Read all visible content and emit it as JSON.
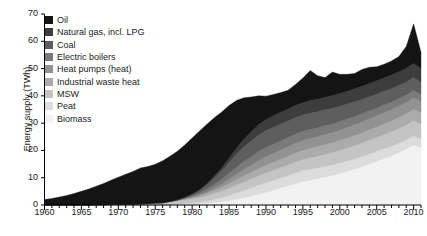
{
  "chart_data": {
    "type": "area",
    "title": "",
    "xlabel": "",
    "ylabel": "Energy supply (TWh)",
    "ylim": [
      0,
      70
    ],
    "xlim": [
      1960,
      2011
    ],
    "y_ticks": [
      0,
      10,
      20,
      30,
      40,
      50,
      60,
      70
    ],
    "x_ticks": [
      1960,
      1965,
      1970,
      1975,
      1980,
      1985,
      1990,
      1995,
      2000,
      2005,
      2010
    ],
    "x_minor_tick_interval": 1,
    "grid": false,
    "legend_position": "top-left",
    "stack_order_top_to_bottom": [
      "Oil",
      "Natural gas, incl. LPG",
      "Coal",
      "Electric boilers",
      "Heat pumps (heat)",
      "Industrial waste heat",
      "MSW",
      "Peat",
      "Biomass"
    ],
    "x": [
      1960,
      1961,
      1962,
      1963,
      1964,
      1965,
      1966,
      1967,
      1968,
      1969,
      1970,
      1971,
      1972,
      1973,
      1974,
      1975,
      1976,
      1977,
      1978,
      1979,
      1980,
      1981,
      1982,
      1983,
      1984,
      1985,
      1986,
      1987,
      1988,
      1989,
      1990,
      1991,
      1992,
      1993,
      1994,
      1995,
      1996,
      1997,
      1998,
      1999,
      2000,
      2001,
      2002,
      2003,
      2004,
      2005,
      2006,
      2007,
      2008,
      2009,
      2010,
      2011
    ],
    "series": [
      {
        "name": "Biomass",
        "color": "#f2f2f2",
        "values": [
          0.0,
          0.0,
          0.0,
          0.0,
          0.0,
          0.0,
          0.0,
          0.0,
          0.0,
          0.0,
          0.0,
          0.0,
          0.0,
          0.0,
          0.0,
          0.0,
          0.0,
          0.1,
          0.1,
          0.2,
          0.3,
          0.4,
          0.6,
          0.9,
          1.2,
          1.6,
          2.1,
          2.6,
          3.2,
          3.9,
          4.6,
          5.4,
          6.2,
          7.0,
          7.9,
          8.6,
          9.1,
          9.6,
          10.2,
          10.8,
          11.5,
          12.3,
          13.1,
          14.0,
          15.0,
          16.0,
          17.0,
          18.0,
          19.2,
          20.5,
          22.0,
          21.0
        ]
      },
      {
        "name": "Peat",
        "color": "#dcdcdc",
        "values": [
          0.0,
          0.0,
          0.0,
          0.0,
          0.0,
          0.0,
          0.0,
          0.0,
          0.0,
          0.0,
          0.0,
          0.0,
          0.0,
          0.0,
          0.0,
          0.0,
          0.0,
          0.1,
          0.2,
          0.3,
          0.4,
          0.6,
          0.9,
          1.2,
          1.5,
          1.9,
          2.3,
          2.7,
          3.0,
          3.3,
          3.5,
          3.6,
          3.7,
          3.8,
          3.9,
          4.0,
          4.0,
          4.0,
          4.0,
          3.9,
          3.9,
          3.9,
          3.8,
          3.8,
          3.7,
          3.6,
          3.6,
          3.5,
          3.4,
          3.3,
          3.3,
          3.2
        ]
      },
      {
        "name": "MSW",
        "color": "#c4c4c4",
        "values": [
          0.0,
          0.0,
          0.0,
          0.0,
          0.0,
          0.0,
          0.0,
          0.1,
          0.1,
          0.2,
          0.2,
          0.3,
          0.3,
          0.4,
          0.5,
          0.6,
          0.7,
          0.9,
          1.1,
          1.3,
          1.5,
          1.7,
          1.9,
          2.2,
          2.4,
          2.7,
          2.9,
          3.1,
          3.3,
          3.5,
          3.6,
          3.7,
          3.8,
          3.9,
          4.0,
          4.1,
          4.2,
          4.3,
          4.4,
          4.5,
          4.6,
          4.7,
          4.8,
          4.9,
          5.0,
          5.1,
          5.2,
          5.3,
          5.4,
          5.5,
          5.6,
          5.5
        ]
      },
      {
        "name": "Industrial waste heat",
        "color": "#ababab",
        "values": [
          0.0,
          0.0,
          0.0,
          0.0,
          0.0,
          0.0,
          0.0,
          0.0,
          0.0,
          0.0,
          0.0,
          0.0,
          0.0,
          0.0,
          0.0,
          0.1,
          0.1,
          0.2,
          0.3,
          0.4,
          0.5,
          0.7,
          0.9,
          1.1,
          1.4,
          1.7,
          2.0,
          2.3,
          2.5,
          2.7,
          2.9,
          3.0,
          3.1,
          3.2,
          3.3,
          3.4,
          3.5,
          3.5,
          3.6,
          3.6,
          3.7,
          3.7,
          3.8,
          3.8,
          3.9,
          3.9,
          4.0,
          4.0,
          4.1,
          4.1,
          4.2,
          4.1
        ]
      },
      {
        "name": "Heat pumps (heat)",
        "color": "#929292",
        "values": [
          0.0,
          0.0,
          0.0,
          0.0,
          0.0,
          0.0,
          0.0,
          0.0,
          0.0,
          0.0,
          0.0,
          0.0,
          0.0,
          0.0,
          0.0,
          0.0,
          0.0,
          0.0,
          0.0,
          0.1,
          0.2,
          0.3,
          0.5,
          0.8,
          1.1,
          1.5,
          1.9,
          2.3,
          2.6,
          2.9,
          3.1,
          3.2,
          3.3,
          3.4,
          3.5,
          3.5,
          3.6,
          3.6,
          3.7,
          3.7,
          3.8,
          3.8,
          3.9,
          3.9,
          4.0,
          4.0,
          4.1,
          4.1,
          4.2,
          4.2,
          4.3,
          4.2
        ]
      },
      {
        "name": "Electric boilers",
        "color": "#7a7a7a",
        "values": [
          0.0,
          0.0,
          0.0,
          0.0,
          0.0,
          0.0,
          0.0,
          0.0,
          0.0,
          0.0,
          0.0,
          0.0,
          0.0,
          0.0,
          0.0,
          0.0,
          0.0,
          0.0,
          0.1,
          0.2,
          0.4,
          0.7,
          1.0,
          1.4,
          1.8,
          2.2,
          2.6,
          2.9,
          3.1,
          3.3,
          3.4,
          3.4,
          3.4,
          3.4,
          3.4,
          3.4,
          3.3,
          3.3,
          3.2,
          3.2,
          3.1,
          3.1,
          3.0,
          3.0,
          2.9,
          2.9,
          2.8,
          2.8,
          2.7,
          2.7,
          2.6,
          2.5
        ]
      },
      {
        "name": "Coal",
        "color": "#5e5e5e",
        "values": [
          0.0,
          0.0,
          0.0,
          0.0,
          0.0,
          0.0,
          0.0,
          0.0,
          0.0,
          0.0,
          0.0,
          0.0,
          0.0,
          0.0,
          0.0,
          0.0,
          0.0,
          0.0,
          0.1,
          0.3,
          0.6,
          1.0,
          1.6,
          2.3,
          3.1,
          4.0,
          4.8,
          5.4,
          5.8,
          6.1,
          6.2,
          6.2,
          6.2,
          6.1,
          6.1,
          6.0,
          6.0,
          5.9,
          5.8,
          5.7,
          5.6,
          5.5,
          5.4,
          5.3,
          5.2,
          5.1,
          5.0,
          4.9,
          4.8,
          4.7,
          4.7,
          4.5
        ]
      },
      {
        "name": "Natural gas, incl. LPG",
        "color": "#3d3d3d",
        "values": [
          0.0,
          0.0,
          0.0,
          0.0,
          0.0,
          0.0,
          0.0,
          0.0,
          0.0,
          0.0,
          0.0,
          0.0,
          0.0,
          0.0,
          0.0,
          0.0,
          0.0,
          0.0,
          0.0,
          0.0,
          0.1,
          0.2,
          0.4,
          0.7,
          1.1,
          1.6,
          2.2,
          2.8,
          3.3,
          3.7,
          4.0,
          4.2,
          4.3,
          4.4,
          4.5,
          4.5,
          4.6,
          4.6,
          4.6,
          4.7,
          4.7,
          4.7,
          4.8,
          4.8,
          4.8,
          4.9,
          4.9,
          5.0,
          5.0,
          5.1,
          5.2,
          5.0
        ]
      },
      {
        "name": "Oil",
        "color": "#141414",
        "values": [
          2.0,
          2.4,
          2.9,
          3.5,
          4.2,
          5.0,
          5.9,
          6.8,
          7.8,
          8.9,
          10.0,
          11.0,
          12.0,
          13.2,
          13.6,
          14.2,
          15.4,
          16.6,
          17.8,
          19.2,
          20.6,
          21.5,
          21.8,
          21.4,
          20.5,
          19.3,
          17.5,
          15.2,
          12.8,
          10.6,
          8.6,
          7.8,
          7.2,
          6.9,
          7.6,
          9.0,
          11.0,
          8.6,
          7.2,
          8.6,
          7.0,
          6.2,
          5.6,
          6.2,
          6.0,
          5.2,
          5.0,
          5.2,
          5.6,
          8.0,
          14.5,
          6.0
        ]
      }
    ]
  },
  "axes": {
    "y_tick_labels": [
      "70",
      "60",
      "50",
      "40",
      "30",
      "20",
      "10",
      "0"
    ],
    "x_tick_labels": [
      "1960",
      "1965",
      "1970",
      "1975",
      "1980",
      "1985",
      "1990",
      "1995",
      "2000",
      "2005",
      "2010"
    ]
  },
  "legend": {
    "items": [
      {
        "label": "Oil",
        "color": "#141414"
      },
      {
        "label": "Natural gas, incl. LPG",
        "color": "#3d3d3d"
      },
      {
        "label": "Coal",
        "color": "#5e5e5e"
      },
      {
        "label": "Electric boilers",
        "color": "#7a7a7a"
      },
      {
        "label": "Heat pumps (heat)",
        "color": "#929292"
      },
      {
        "label": "Industrial waste heat",
        "color": "#ababab"
      },
      {
        "label": "MSW",
        "color": "#c4c4c4"
      },
      {
        "label": "Peat",
        "color": "#dcdcdc"
      },
      {
        "label": "Biomass",
        "color": "#f2f2f2"
      }
    ]
  }
}
